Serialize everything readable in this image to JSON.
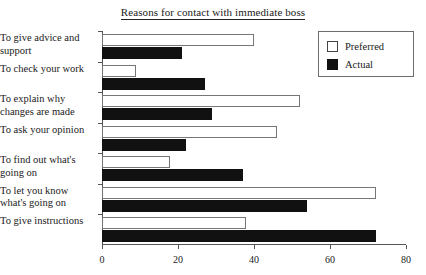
{
  "chart_data": {
    "type": "bar",
    "orientation": "horizontal",
    "title": "Reasons for contact with immediate boss",
    "xlabel": "",
    "ylabel": "",
    "xlim": [
      0,
      80
    ],
    "xticks": [
      0,
      20,
      40,
      60,
      80
    ],
    "xtick_labels": [
      "0",
      "20",
      "40",
      "60",
      "80"
    ],
    "grid": false,
    "legend_position": "top-right",
    "categories": [
      "To give advice and support",
      "To check your work",
      "To explain why changes are made",
      "To ask your opinion",
      "To find out what's going on",
      "To let you know what's going on",
      "To give instructions"
    ],
    "series": [
      {
        "name": "Preferred",
        "color": "#ffffff",
        "edge_color": "#767676",
        "values": [
          40,
          9,
          52,
          46,
          18,
          72,
          38
        ]
      },
      {
        "name": "Actual",
        "color": "#111111",
        "edge_color": "#111111",
        "values": [
          21,
          27,
          29,
          22,
          37,
          54,
          72
        ]
      }
    ]
  },
  "legend": {
    "items": [
      {
        "label": "Preferred",
        "swatch": "preferred-swatch"
      },
      {
        "label": "Actual",
        "swatch": "actual-swatch"
      }
    ]
  }
}
